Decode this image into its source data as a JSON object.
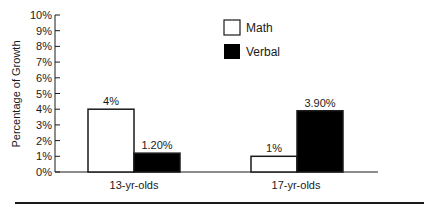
{
  "chart_data": {
    "type": "bar",
    "title": "",
    "xlabel": "",
    "ylabel": "Percentage of Growth",
    "ylim": [
      0,
      10
    ],
    "yticks": [
      "0%",
      "1%",
      "2%",
      "3%",
      "4%",
      "5%",
      "6%",
      "7%",
      "8%",
      "9%",
      "10%"
    ],
    "categories": [
      "13-yr-olds",
      "17-yr-olds"
    ],
    "series": [
      {
        "name": "Math",
        "values": [
          4,
          1
        ],
        "labels": [
          "4%",
          "1%"
        ],
        "color": "#ffffff"
      },
      {
        "name": "Verbal",
        "values": [
          1.2,
          3.9
        ],
        "labels": [
          "1.20%",
          "3.90%"
        ],
        "color": "#000000"
      }
    ],
    "grid": false,
    "legend_position": "top-center"
  },
  "colors": {
    "axis": "#1a1a1a",
    "math_fill": "#ffffff",
    "verbal_fill": "#000000"
  }
}
